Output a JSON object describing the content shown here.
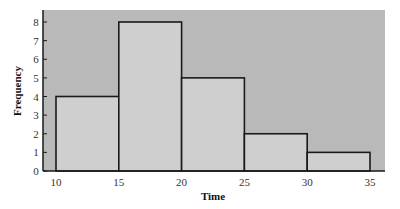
{
  "chart_data": {
    "type": "bar",
    "subtype": "histogram",
    "title": "",
    "xlabel": "Time",
    "ylabel": "Frequency",
    "bins": [
      {
        "start": 10,
        "end": 15,
        "frequency": 4
      },
      {
        "start": 15,
        "end": 20,
        "frequency": 8
      },
      {
        "start": 20,
        "end": 25,
        "frequency": 5
      },
      {
        "start": 25,
        "end": 30,
        "frequency": 2
      },
      {
        "start": 30,
        "end": 35,
        "frequency": 1
      }
    ],
    "categories": [
      "10-15",
      "15-20",
      "20-25",
      "25-30",
      "30-35"
    ],
    "values": [
      4,
      8,
      5,
      2,
      1
    ],
    "xticks": [
      10,
      15,
      20,
      25,
      30,
      35
    ],
    "yticks": [
      0,
      1,
      2,
      3,
      4,
      5,
      6,
      7,
      8
    ],
    "ylim": [
      0,
      8.6
    ],
    "xlim": [
      9,
      36.2
    ],
    "grid": false,
    "legend": null,
    "colors": {
      "plot_background": "#b9b9b9",
      "bar_fill": "#cfcfcf",
      "bar_edge": "#1a1a1a",
      "axis": "#1a1a1a"
    }
  }
}
